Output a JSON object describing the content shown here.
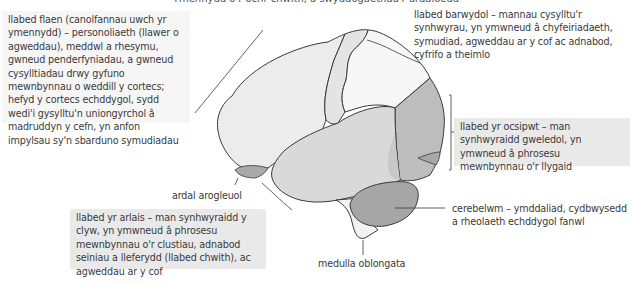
{
  "figure": {
    "caption_partial": "Ymennydd o'r ochr chwith, a swyddogaethau'r ardaloedd",
    "labels": {
      "frontal_lobe": "llabed flaen (canolfannau uwch yr ymennydd) – personoliaeth (llawer o agweddau), meddwl a rhesymu, gwneud penderfyniadau, a gwneud cysylltiadau drwy gyfuno mewnbynnau o weddill y cortecs; hefyd y cortecs echddygol, sydd wedi'i gysylltu'n uniongyrchol â madruddyn y cefn, yn anfon impylsau sy'n sbarduno symudiadau",
      "parietal_lobe": "llabed barwydol – mannau cysylltu'r synhwyrau, yn ymwneud â chyfeiriadaeth, symudiad, agweddau ar y cof ac adnabod, cyfrifo a theimlo",
      "occipital_lobe": "llabed yr ocsipwt – man synhwyraidd gweledol, yn ymwneud â phrosesu mewnbynnau o'r llygaid",
      "cerebellum": "cerebelwm – ymddaliad, cydbwysedd a rheolaeth echddygol fanwl",
      "olfactory_area": "ardal arogleuol",
      "temporal_lobe": "llabed yr arlais – man synhwyraidd y clyw, yn ymwneud â phrosesu mewnbynnau o'r clustiau, adnabod seiniau a lleferydd (llabed chwith), ac agweddau ar y cof",
      "medulla": "medulla oblongata"
    },
    "colors": {
      "frontal": "#ececec",
      "motor_strip": "#e4e4e4",
      "parietal": "#f7f7f7",
      "temporal": "#d9d9d9",
      "occipital": "#bdbdbd",
      "cerebellum": "#a6a6a6",
      "olfactory": "#a9a9a9",
      "brainstem": "#f2f2f2",
      "outline": "#3a3a3a"
    }
  }
}
